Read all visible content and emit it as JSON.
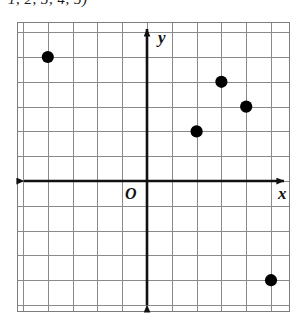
{
  "caption": {
    "text": "1, 2, 3, 4, 5)"
  },
  "figure": {
    "name": "coordinate-plane-scatter-plot",
    "origin_label": "O",
    "x_axis_label": "x",
    "y_axis_label": "y"
  },
  "chart_data": {
    "type": "scatter",
    "title": "",
    "xlabel": "x",
    "ylabel": "y",
    "grid": true,
    "legend": false,
    "axis_arrows": "both",
    "origin_label": "O",
    "xlim": [
      -5.2,
      5.8
    ],
    "ylim": [
      -5.3,
      6.4
    ],
    "xtick_step": 1,
    "ytick_step": 1,
    "tick_labels_shown": false,
    "points": [
      {
        "x": -4,
        "y": 5
      },
      {
        "x": 3,
        "y": 4
      },
      {
        "x": 4,
        "y": 3
      },
      {
        "x": 2,
        "y": 2
      },
      {
        "x": 5,
        "y": -4
      }
    ],
    "point_color": "#000000",
    "grid_color": "#8a8a8a",
    "axis_color": "#111111"
  },
  "geometry": {
    "grid_left": 17,
    "grid_right": 290,
    "grid_top": 22,
    "grid_bottom": 312,
    "cell": 24.8,
    "origin_x": 147,
    "origin_y": 181
  }
}
